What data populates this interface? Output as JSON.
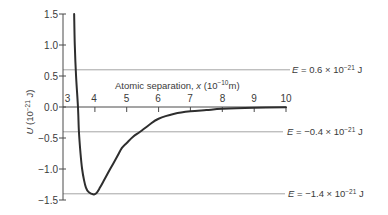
{
  "chart_data": {
    "type": "line",
    "title": "",
    "xlabel": "Atomic separation, x (10⁻¹⁰ m)",
    "ylabel": "U (10⁻²¹ J)",
    "xlabel_parts": {
      "text": "Atomic separation, ",
      "symbol": "x",
      "unit_prefix": " (10",
      "exponent": "−10",
      "unit_suffix": "m)"
    },
    "ylabel_parts": {
      "symbol": "U",
      "unit_prefix": " (10",
      "exponent": "−21",
      "unit_suffix": " J)"
    },
    "xlim": [
      3,
      10
    ],
    "ylim": [
      -1.5,
      1.5
    ],
    "x_ticks": [
      "3",
      "4",
      "5",
      "6",
      "7",
      "8",
      "9",
      "10"
    ],
    "y_ticks": [
      "1.5",
      "1.0",
      "0.5",
      "0.0",
      "−0.5",
      "−1.0",
      "−1.5"
    ],
    "grid": false,
    "legend": null,
    "series": [
      {
        "name": "U(x)",
        "x": [
          3.35,
          3.37,
          3.41,
          3.47,
          3.5,
          3.55,
          3.6,
          3.66,
          3.72,
          3.8,
          3.9,
          3.97,
          4.05,
          4.16,
          4.3,
          4.48,
          4.7,
          4.85,
          5.0,
          5.2,
          5.42,
          5.7,
          6.0,
          6.5,
          7.0,
          7.5,
          8.0,
          9.0,
          10.0
        ],
        "y": [
          1.5,
          1.0,
          0.5,
          0.0,
          -0.4,
          -0.75,
          -1.0,
          -1.18,
          -1.3,
          -1.37,
          -1.4,
          -1.41,
          -1.39,
          -1.3,
          -1.17,
          -1.0,
          -0.8,
          -0.66,
          -0.58,
          -0.48,
          -0.4,
          -0.29,
          -0.19,
          -0.11,
          -0.07,
          -0.05,
          -0.03,
          -0.012,
          -0.003
        ]
      }
    ],
    "annotations": [
      {
        "type": "hline",
        "y": 0.6,
        "symbol": "E",
        "prefix": " = 0.6 × 10",
        "exponent": "−21",
        "unit": " J",
        "label": "E = 0.6 × 10⁻²¹ J"
      },
      {
        "type": "hline",
        "y": -0.4,
        "symbol": "E",
        "prefix": " = −0.4 × 10",
        "exponent": "−21",
        "unit": " J",
        "label": "E = −0.4 × 10⁻²¹ J"
      },
      {
        "type": "hline",
        "y": -1.4,
        "symbol": "E",
        "prefix": " = −1.4 × 10",
        "exponent": "−21",
        "unit": " J",
        "label": "E = −1.4 × 10⁻²¹ J"
      }
    ],
    "colors": {
      "curve": "#2e2e2e",
      "axes": "#4a4a4a",
      "energy_lines": "#9a9a9a",
      "text": "#3a3a3a"
    }
  }
}
